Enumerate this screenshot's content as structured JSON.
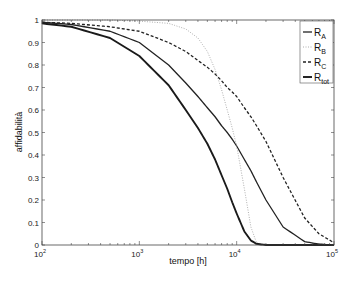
{
  "chart_data": {
    "type": "line",
    "title": "",
    "xlabel": "tempo [h]",
    "ylabel": "affidabilità",
    "xscale": "log",
    "xlim": [
      100,
      100000
    ],
    "ylim": [
      0,
      1
    ],
    "xticks": [
      {
        "value": 100,
        "base": "10",
        "exp": "2"
      },
      {
        "value": 1000,
        "base": "10",
        "exp": "3"
      },
      {
        "value": 10000,
        "base": "10",
        "exp": "4"
      },
      {
        "value": 100000,
        "base": "10",
        "exp": "5"
      }
    ],
    "yticks": [
      "0",
      "0.1",
      "0.2",
      "0.3",
      "0.4",
      "0.5",
      "0.6",
      "0.7",
      "0.8",
      "0.9",
      "1"
    ],
    "grid": false,
    "legend_position": "top-right inside",
    "x": [
      100,
      200,
      500,
      1000,
      2000,
      3000,
      4000,
      5000,
      6000,
      7000,
      8000,
      9000,
      10000,
      12000,
      14000,
      16000,
      20000,
      30000,
      50000,
      70000,
      100000
    ],
    "series": [
      {
        "name": "R_A",
        "label_main": "R",
        "label_sub": "A",
        "style": "solid",
        "color": "#222222",
        "width": 1.3,
        "values": [
          0.99,
          0.98,
          0.95,
          0.9,
          0.8,
          0.72,
          0.66,
          0.61,
          0.57,
          0.53,
          0.5,
          0.47,
          0.44,
          0.38,
          0.33,
          0.28,
          0.2,
          0.08,
          0.015,
          0.004,
          0.0
        ]
      },
      {
        "name": "R_B",
        "label_main": "R",
        "label_sub": "B",
        "style": "dotted-thin",
        "color": "#9a9a9a",
        "width": 0.8,
        "values": [
          1.0,
          1.0,
          1.0,
          0.995,
          0.985,
          0.96,
          0.92,
          0.86,
          0.78,
          0.69,
          0.6,
          0.52,
          0.44,
          0.25,
          0.08,
          0.01,
          0.0,
          0.0,
          0.0,
          0.0,
          0.0
        ]
      },
      {
        "name": "R_C",
        "label_main": "R",
        "label_sub": "C",
        "style": "dashed",
        "color": "#222222",
        "width": 1.3,
        "values": [
          0.99,
          0.985,
          0.97,
          0.95,
          0.9,
          0.86,
          0.82,
          0.79,
          0.76,
          0.73,
          0.7,
          0.68,
          0.66,
          0.61,
          0.57,
          0.53,
          0.46,
          0.3,
          0.12,
          0.05,
          0.01
        ]
      },
      {
        "name": "R_tot",
        "label_main": "R",
        "label_sub": "tot",
        "style": "solid-thick",
        "color": "#1a1a1a",
        "width": 1.9,
        "values": [
          0.985,
          0.97,
          0.92,
          0.84,
          0.71,
          0.6,
          0.52,
          0.45,
          0.38,
          0.31,
          0.25,
          0.19,
          0.14,
          0.06,
          0.02,
          0.005,
          0.0,
          0.0,
          0.0,
          0.0,
          0.0
        ]
      }
    ]
  }
}
